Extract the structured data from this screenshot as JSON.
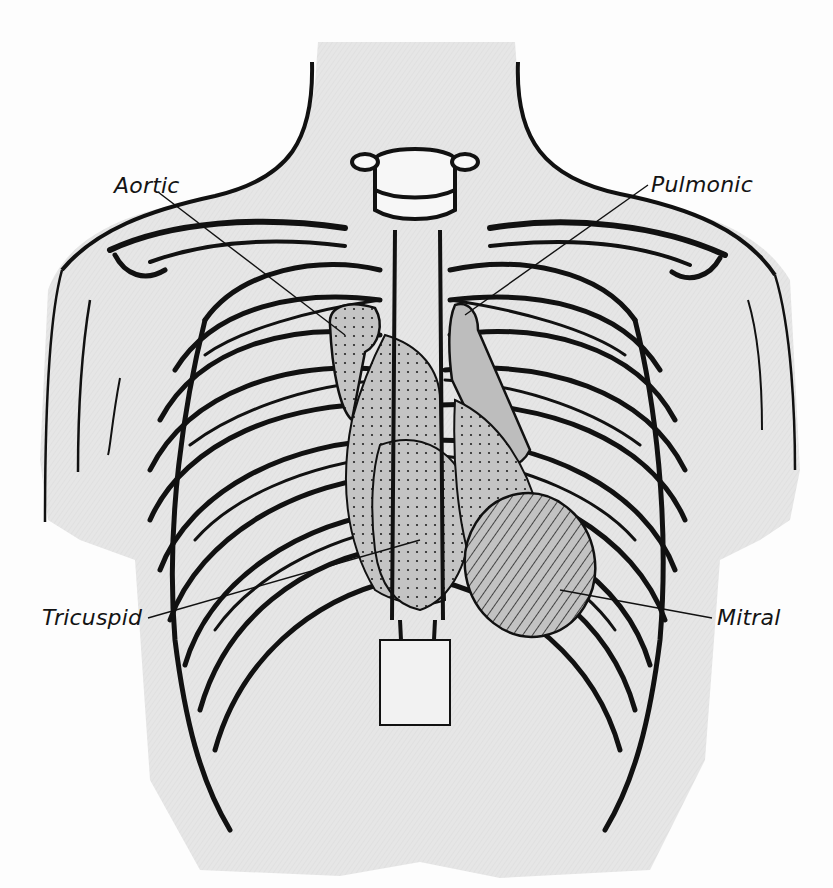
{
  "figure": {
    "labels": {
      "aortic": "Aortic",
      "pulmonic": "Pulmonic",
      "tricuspid": "Tricuspid",
      "mitral": "Mitral"
    },
    "areas": [
      {
        "name": "Aortic",
        "fill": "stippled",
        "position": "right 2nd intercostal space"
      },
      {
        "name": "Pulmonic",
        "fill": "stippled",
        "position": "left 2nd intercostal space"
      },
      {
        "name": "Tricuspid",
        "fill": "stippled",
        "position": "lower left sternal border"
      },
      {
        "name": "Mitral",
        "fill": "hatched",
        "position": "apex, left 5th intercostal space"
      }
    ],
    "colors": {
      "ink": "#111111",
      "body_shade": "#e4e4e4",
      "region_shade": "#bdbdbd",
      "paper": "#fdfdfd"
    }
  }
}
